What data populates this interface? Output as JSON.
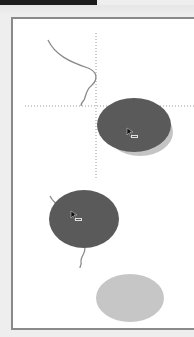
{
  "window": {
    "title_bar_color": "#1c1c1c",
    "background_color": "#eeeeee"
  },
  "canvas": {
    "background": "#ffffff",
    "border_color": "#8a8a8a",
    "crosshair": {
      "style": "dotted",
      "color": "#9a9a9a",
      "vertical_x": 96,
      "horizontal_y": 106
    },
    "shapes": [
      {
        "id": "ellipse-dark-upper",
        "kind": "ellipse",
        "fill": "#5a5a5a",
        "shadow_fill": "#c4c4c4",
        "cx": 134,
        "cy": 125,
        "rx": 37,
        "ry": 27
      },
      {
        "id": "ellipse-dark-middle",
        "kind": "ellipse",
        "fill": "#5a5a5a",
        "cx": 84,
        "cy": 219,
        "rx": 35,
        "ry": 29
      },
      {
        "id": "ellipse-light-lower",
        "kind": "ellipse",
        "fill": "#c6c6c6",
        "cx": 130,
        "cy": 298,
        "rx": 34,
        "ry": 24
      }
    ],
    "cursors": [
      {
        "id": "cursor-upper",
        "icon": "drag-move-cursor-icon",
        "x": 127,
        "y": 129
      },
      {
        "id": "cursor-middle",
        "icon": "drag-move-cursor-icon",
        "x": 71,
        "y": 212
      }
    ]
  }
}
